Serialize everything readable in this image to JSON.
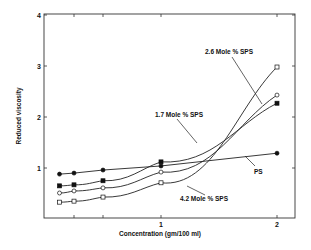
{
  "chart_data": {
    "type": "line",
    "title": "",
    "xlabel": "Concentration (gm/100 ml)",
    "ylabel": "Reduced viscosity",
    "xlim": [
      0,
      2.15
    ],
    "ylim": [
      0,
      4
    ],
    "x_ticks": [
      0.25,
      0.5,
      1,
      2
    ],
    "x_tick_labels": [
      "",
      "",
      "1",
      "2"
    ],
    "y_ticks": [
      1,
      2,
      3,
      4
    ],
    "y_tick_labels": [
      "1",
      "2",
      "3",
      "4"
    ],
    "grid": false,
    "legend": "inline annotations",
    "x": [
      0.125,
      0.25,
      0.5,
      1.0,
      2.0
    ],
    "series": [
      {
        "name": "PS",
        "marker": "filled-circle",
        "values": [
          0.88,
          0.9,
          0.96,
          1.04,
          1.29
        ]
      },
      {
        "name": "1.7 Mole % SPS",
        "marker": "filled-square",
        "values": [
          0.65,
          0.67,
          0.75,
          1.12,
          2.27
        ]
      },
      {
        "name": "2.6 Mole % SPS",
        "marker": "open-circle",
        "values": [
          0.51,
          0.55,
          0.61,
          0.92,
          2.43
        ]
      },
      {
        "name": "4.2 Mole % SPS",
        "marker": "open-square",
        "values": [
          0.33,
          0.35,
          0.43,
          0.71,
          2.98
        ]
      }
    ],
    "annotations": [
      {
        "text": "2.6 Mole % SPS",
        "series": "2.6 Mole % SPS"
      },
      {
        "text": "1.7 Mole % SPS",
        "series": "1.7 Mole % SPS"
      },
      {
        "text": "PS",
        "series": "PS"
      },
      {
        "text": "4.2 Mole % SPS",
        "series": "4.2 Mole % SPS"
      }
    ]
  }
}
